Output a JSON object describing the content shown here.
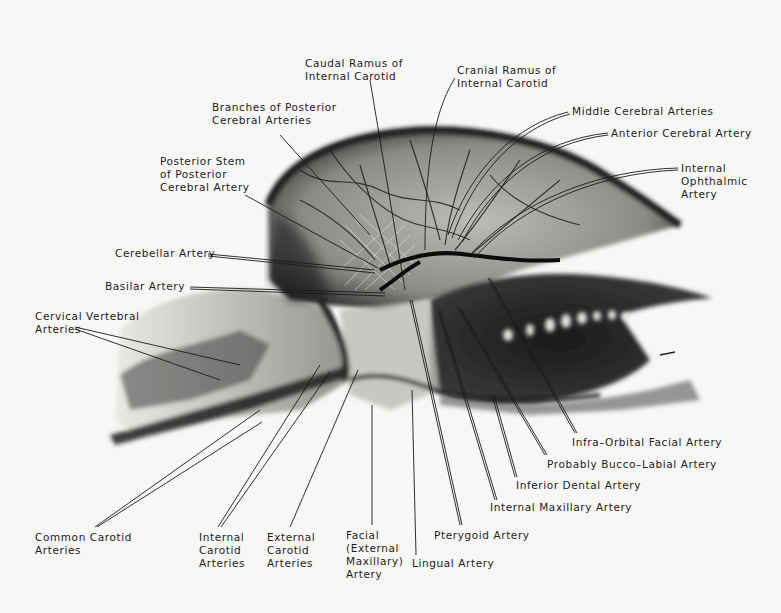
{
  "figure": {
    "colors": {
      "background": "#f7f7f5",
      "ink": "#1c1c1c",
      "radiograph_dark": "#111111",
      "radiograph_mid": "#6d6d6d",
      "radiograph_light": "#d9d9d6"
    }
  },
  "labels": {
    "caudal_ramus": [
      "Caudal Ramus of",
      "Internal Carotid"
    ],
    "cranial_ramus": [
      "Cranial Ramus of",
      "Internal Carotid"
    ],
    "branches_posterior_cerebral": [
      "Branches of Posterior",
      "Cerebral Arteries"
    ],
    "middle_cerebral": [
      "Middle Cerebral Arteries"
    ],
    "anterior_cerebral": [
      "Anterior Cerebral Artery"
    ],
    "internal_ophthalmic": [
      "Internal",
      "Ophthalmic",
      "Artery"
    ],
    "posterior_stem": [
      "Posterior Stem",
      "of Posterior",
      "Cerebral Artery"
    ],
    "cerebellar": [
      "Cerebellar Artery"
    ],
    "basilar": [
      "Basilar Artery"
    ],
    "cervical_vertebral": [
      "Cervical Vertebral",
      "Arteries"
    ],
    "infra_orbital": [
      "Infra–Orbital Facial Artery"
    ],
    "bucco_labial": [
      "Probably Bucco–Labial Artery"
    ],
    "inferior_dental": [
      "Inferior Dental Artery"
    ],
    "internal_maxillary": [
      "Internal Maxillary Artery"
    ],
    "pterygoid": [
      "Pterygoid Artery"
    ],
    "lingual": [
      "Lingual Artery"
    ],
    "facial": [
      "Facial",
      "(External",
      "Maxillary)",
      "Artery"
    ],
    "external_carotid": [
      "External",
      "Carotid",
      "Arteries"
    ],
    "internal_carotid": [
      "Internal",
      "Carotid",
      "Arteries"
    ],
    "common_carotid": [
      "Common Carotid",
      "Arteries"
    ]
  }
}
